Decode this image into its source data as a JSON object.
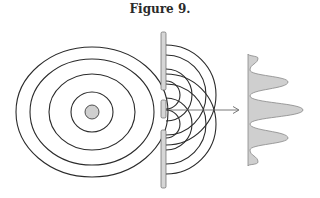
{
  "figure": {
    "title": "Figure 9.",
    "colors": {
      "stroke": "#2b2b2b",
      "fill": "#cfcfcf",
      "barrier": "#d6d6d6",
      "arrow": "#555555"
    },
    "source": {
      "cx": 92,
      "cy": 112,
      "r": 7
    },
    "wavefronts": [
      {
        "rx": 21,
        "ry": 20
      },
      {
        "rx": 43,
        "ry": 38
      },
      {
        "rx": 62,
        "ry": 53
      },
      {
        "rx": 76,
        "ry": 65
      }
    ],
    "barrier": {
      "x": 161,
      "width": 5,
      "segments": [
        [
          32,
          90
        ],
        [
          100,
          118
        ],
        [
          130,
          188
        ]
      ]
    },
    "slits": [
      95,
      124
    ],
    "intensity_pattern": {
      "left_x": 248,
      "peaks": [
        {
          "y": 58,
          "x": 258
        },
        {
          "y": 82,
          "x": 288
        },
        {
          "y": 110,
          "x": 303
        },
        {
          "y": 138,
          "x": 288
        },
        {
          "y": 162,
          "x": 258
        }
      ]
    }
  }
}
